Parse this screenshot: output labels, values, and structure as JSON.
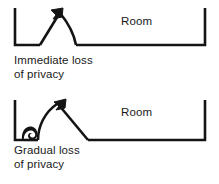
{
  "figure": {
    "background_color": "#ffffff",
    "ink_color": "#141414",
    "panels": [
      {
        "id": "immediate",
        "room_label": "Room",
        "caption_line1": "Immediate loss",
        "caption_line2": "of privacy",
        "arrow_style": "straight-rise-then-concave-fall",
        "arrow_direction": "up-right"
      },
      {
        "id": "gradual",
        "room_label": "Room",
        "caption_line1": "Gradual loss",
        "caption_line2": "of privacy",
        "arrow_style": "curl-then-curved-rise-then-straight-fall",
        "arrow_direction": "up-right"
      }
    ]
  }
}
